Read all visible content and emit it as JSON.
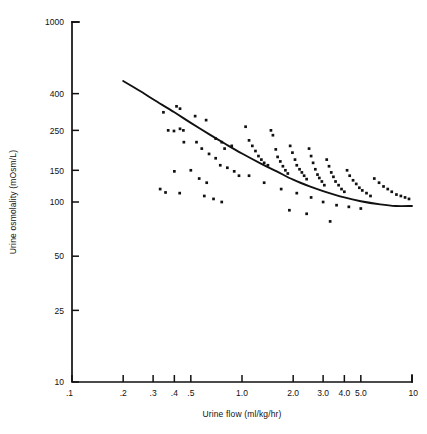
{
  "chart_data": {
    "type": "scatter",
    "title": "",
    "subtitle": "",
    "xlabel": "Urine flow (ml/kg/hr)",
    "ylabel": "Urine osmolality (mOsm/L)",
    "xscale": "log",
    "yscale": "log",
    "xlim": [
      0.1,
      10
    ],
    "ylim": [
      10,
      1000
    ],
    "grid": false,
    "legend": null,
    "legend_position": "none",
    "annotations": [],
    "xticks": [
      0.1,
      0.2,
      0.3,
      0.4,
      0.5,
      1.0,
      2.0,
      3.0,
      4.0,
      5.0,
      10
    ],
    "xticklabels": [
      ".1",
      ".2",
      ".3",
      ".4",
      ".5",
      "1.0",
      "2.0",
      "3.0",
      "4.0",
      "5.0",
      "10"
    ],
    "yticks": [
      10,
      25,
      50,
      100,
      150,
      250,
      400,
      1000
    ],
    "yticklabels": [
      "10",
      "25",
      "50",
      "100",
      "150",
      "250",
      "400",
      "1000"
    ],
    "marker": "square",
    "marker_color": "#111111",
    "curve_color": "#111111",
    "series": [
      {
        "name": "observations",
        "n_points": 101,
        "x": [
          0.345,
          0.412,
          0.432,
          0.432,
          0.368,
          0.398,
          0.452,
          0.455,
          0.4,
          0.355,
          0.53,
          0.615,
          0.7,
          0.76,
          0.79,
          0.87,
          0.54,
          0.58,
          0.64,
          0.7,
          0.745,
          0.82,
          0.9,
          0.96,
          0.5,
          0.56,
          0.62,
          0.33,
          0.43,
          0.6,
          0.68,
          0.76,
          1.05,
          1.1,
          1.15,
          1.2,
          1.25,
          1.3,
          1.35,
          1.42,
          1.48,
          1.52,
          1.58,
          1.62,
          1.68,
          1.74,
          1.8,
          1.86,
          1.92,
          1.98,
          2.05,
          2.1,
          2.18,
          2.25,
          2.32,
          2.4,
          2.48,
          2.55,
          2.62,
          2.7,
          2.78,
          2.85,
          2.95,
          3.05,
          3.15,
          3.25,
          3.35,
          3.45,
          3.55,
          3.7,
          3.85,
          4.0,
          4.15,
          4.3,
          4.5,
          4.7,
          4.9,
          5.1,
          5.4,
          5.7,
          6.0,
          6.4,
          6.8,
          7.2,
          7.6,
          8.1,
          8.6,
          9.1,
          9.6,
          1.1,
          1.35,
          1.7,
          2.1,
          2.55,
          3.0,
          3.6,
          4.25,
          5.0,
          2.4,
          3.3,
          1.9
        ],
        "y": [
          315,
          340,
          330,
          255,
          250,
          248,
          250,
          215,
          148,
          113,
          300,
          285,
          225,
          215,
          198,
          205,
          215,
          198,
          185,
          175,
          160,
          155,
          148,
          140,
          150,
          135,
          128,
          118,
          112,
          108,
          104,
          100,
          262,
          220,
          205,
          192,
          180,
          172,
          165,
          160,
          250,
          235,
          196,
          178,
          168,
          158,
          150,
          144,
          205,
          188,
          172,
          160,
          152,
          146,
          140,
          134,
          198,
          180,
          165,
          152,
          142,
          136,
          130,
          124,
          172,
          158,
          146,
          138,
          130,
          124,
          118,
          114,
          150,
          140,
          132,
          126,
          120,
          116,
          112,
          108,
          135,
          128,
          122,
          118,
          114,
          110,
          108,
          106,
          104,
          140,
          128,
          118,
          112,
          106,
          100,
          96,
          94,
          92,
          86,
          78,
          90
        ]
      }
    ],
    "fit_curve": {
      "name": "fitted trend",
      "x": [
        0.2,
        0.25,
        0.3,
        0.4,
        0.5,
        0.65,
        0.8,
        1.0,
        1.3,
        1.6,
        2.0,
        2.5,
        3.0,
        4.0,
        5.0,
        6.5,
        8.0,
        10.0
      ],
      "y": [
        470,
        415,
        372,
        315,
        275,
        236,
        210,
        186,
        163,
        148,
        133,
        122,
        115,
        106,
        101,
        97,
        95,
        95
      ]
    }
  },
  "figure": {
    "background": "#ffffff",
    "foreground": "#111111"
  }
}
